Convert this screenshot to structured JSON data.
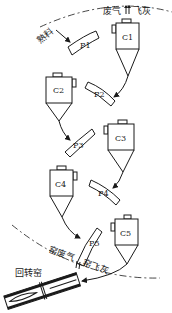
{
  "diagram": {
    "type": "cyclone preheater flow diagram",
    "cyclones": [
      {
        "id": "C1",
        "label": "C1"
      },
      {
        "id": "C2",
        "label": "C2"
      },
      {
        "id": "C3",
        "label": "C3"
      },
      {
        "id": "C4",
        "label": "C4"
      },
      {
        "id": "C5",
        "label": "C5"
      }
    ],
    "pipes": [
      {
        "id": "P1",
        "label": "P1"
      },
      {
        "id": "P2",
        "label": "P2"
      },
      {
        "id": "P3",
        "label": "P3"
      },
      {
        "id": "P4",
        "label": "P4"
      },
      {
        "id": "P5",
        "label": "P5"
      }
    ],
    "labels": {
      "exhaust_top_gas": "废气",
      "exhaust_top_ash": "飞灰",
      "raw_material": "熟料",
      "kiln_gas": "窑废气",
      "kiln_ash": "窑飞灰",
      "rotary_kiln": "回转窑"
    }
  }
}
